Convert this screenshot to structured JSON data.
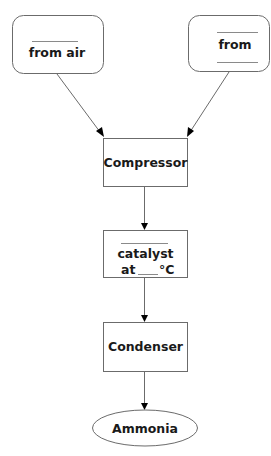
{
  "diagram": {
    "type": "flowchart",
    "colors": {
      "stroke": "#6b6b6b",
      "text": "#1a1a1a",
      "arrowhead": "#000000",
      "background": "#ffffff"
    },
    "nodes": {
      "left_input": {
        "shape": "rounded-rectangle",
        "blank_above": true,
        "text": "from air"
      },
      "right_input": {
        "shape": "rounded-rectangle",
        "blank_above": true,
        "blank_below": true,
        "text": "from"
      },
      "compressor": {
        "shape": "rectangle",
        "text": "Compressor"
      },
      "reactor": {
        "shape": "rectangle",
        "blank_above": true,
        "line1": "catalyst",
        "line2_prefix": "at",
        "line2_suffix": "°C"
      },
      "condenser": {
        "shape": "rectangle",
        "text": "Condenser"
      },
      "product": {
        "shape": "ellipse",
        "text": "Ammonia"
      }
    },
    "edges": [
      {
        "from": "left_input",
        "to": "compressor"
      },
      {
        "from": "right_input",
        "to": "compressor"
      },
      {
        "from": "compressor",
        "to": "reactor"
      },
      {
        "from": "reactor",
        "to": "condenser"
      },
      {
        "from": "condenser",
        "to": "product"
      }
    ]
  }
}
